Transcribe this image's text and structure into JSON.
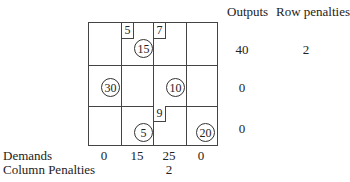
{
  "headers": {
    "outputs": "Outputs",
    "row_penalties": "Row penalties"
  },
  "rows": [
    {
      "output": "40",
      "penalty": "2"
    },
    {
      "output": "0",
      "penalty": ""
    },
    {
      "output": "0",
      "penalty": ""
    }
  ],
  "cost_boxes": [
    {
      "row": 0,
      "col": 1,
      "value": "5"
    },
    {
      "row": 0,
      "col": 2,
      "value": "7"
    },
    {
      "row": 2,
      "col": 2,
      "value": "9"
    }
  ],
  "allocations": [
    {
      "row": 0,
      "col": 1,
      "value": "15"
    },
    {
      "row": 1,
      "col": 0,
      "value": "30"
    },
    {
      "row": 1,
      "col": 2,
      "value": "10"
    },
    {
      "row": 2,
      "col": 1,
      "value": "5"
    },
    {
      "row": 2,
      "col": 3,
      "value": "20"
    }
  ],
  "demands": {
    "label": "Demands",
    "values": [
      "0",
      "15",
      "25",
      "0"
    ]
  },
  "column_penalties": {
    "label": "Column Penalties",
    "values": [
      "",
      "",
      "2",
      ""
    ]
  }
}
